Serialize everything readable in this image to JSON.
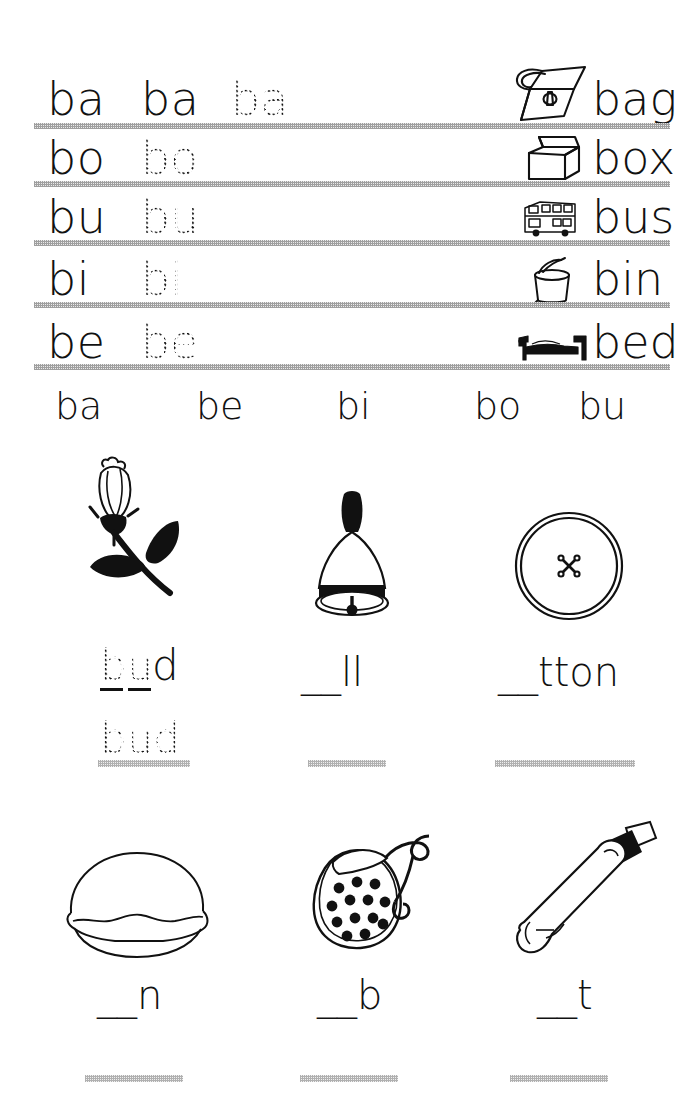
{
  "worksheet": {
    "title": "Letter b syllable and word tracing worksheet",
    "line_color": "#9a9a9a",
    "ink_color": "#111111"
  },
  "trace_rows": [
    {
      "model": "ba",
      "copy": "ba",
      "trace": "ba",
      "picture": "handbag-icon",
      "word": "bag"
    },
    {
      "model": "bo",
      "copy": "",
      "trace": "bo",
      "picture": "box-icon",
      "word": "box"
    },
    {
      "model": "bu",
      "copy": "",
      "trace": "bu",
      "picture": "bus-icon",
      "word": "bus"
    },
    {
      "model": "bi",
      "copy": "",
      "trace": "bi",
      "picture": "bin-icon",
      "word": "bin"
    },
    {
      "model": "be",
      "copy": "",
      "trace": "be",
      "picture": "bed-icon",
      "word": "bed"
    }
  ],
  "syllable_row": {
    "items": [
      "ba",
      "be",
      "bi",
      "bo",
      "bu"
    ]
  },
  "picture_words": [
    {
      "picture": "rose-bud-icon",
      "answer_prefix": "bu",
      "answer_suffix": "d",
      "display": "bud",
      "prefix_style": "dotted",
      "suffix_style": "solid",
      "has_prefix_underscores": true,
      "trace_word": "bud",
      "has_write_line": true
    },
    {
      "picture": "hand-bell-icon",
      "answer_prefix": "__",
      "answer_suffix": "ll",
      "display": "__ll",
      "prefix_style": "blank",
      "suffix_style": "solid",
      "has_prefix_underscores": false,
      "trace_word": "",
      "has_write_line": true
    },
    {
      "picture": "button-icon",
      "answer_prefix": "__",
      "answer_suffix": "tton",
      "display": "__tton",
      "prefix_style": "blank",
      "suffix_style": "solid",
      "has_prefix_underscores": false,
      "trace_word": "",
      "has_write_line": true
    },
    {
      "picture": "bun-icon",
      "answer_prefix": "__",
      "answer_suffix": "n",
      "display": "__n",
      "prefix_style": "blank",
      "suffix_style": "solid",
      "has_prefix_underscores": false,
      "trace_word": "",
      "has_write_line": true
    },
    {
      "picture": "bib-icon",
      "answer_prefix": "__",
      "answer_suffix": "b",
      "display": "__b",
      "prefix_style": "blank",
      "suffix_style": "solid",
      "has_prefix_underscores": false,
      "trace_word": "",
      "has_write_line": true
    },
    {
      "picture": "cricket-bat-icon",
      "answer_prefix": "__",
      "answer_suffix": "t",
      "display": "__t",
      "prefix_style": "blank",
      "suffix_style": "solid",
      "has_prefix_underscores": false,
      "trace_word": "",
      "has_write_line": true
    }
  ]
}
